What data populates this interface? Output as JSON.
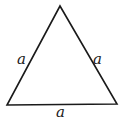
{
  "diagram": {
    "type": "equilateral-triangle",
    "stroke_color": "#1a1a1a",
    "vertices": {
      "top": [
        60,
        6
      ],
      "bottom_left": [
        7,
        105
      ],
      "bottom_right": [
        117,
        104
      ]
    },
    "labels": {
      "left_side": "a",
      "right_side": "a",
      "bottom_side": "a"
    }
  }
}
